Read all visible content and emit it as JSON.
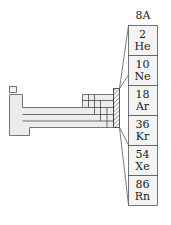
{
  "group_label": "8A",
  "elements": [
    {
      "number": "2",
      "symbol": "He"
    },
    {
      "number": "10",
      "symbol": "Ne"
    },
    {
      "number": "18",
      "symbol": "Ar"
    },
    {
      "number": "36",
      "symbol": "Kr"
    },
    {
      "number": "54",
      "symbol": "Xe"
    },
    {
      "number": "86",
      "symbol": "Rn"
    }
  ],
  "colors": {
    "outline": "#555555",
    "fill": "#ebebeb",
    "text": "#222222"
  }
}
